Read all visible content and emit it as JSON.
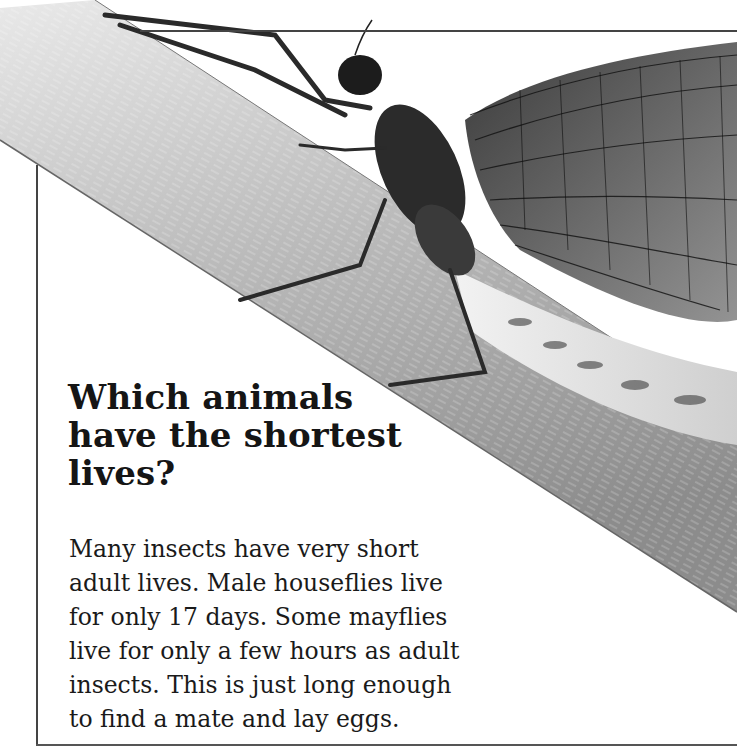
{
  "article": {
    "headline_lines": [
      "Which animals",
      "have the shortest",
      "lives?"
    ],
    "body_lines": [
      "Many insects have very short",
      "adult lives. Male houseflies live",
      "for only 17 days. Some mayflies",
      "live for only a few hours as adult",
      "insects. This is just long enough",
      "to find a mate and lay eggs."
    ]
  },
  "image": {
    "subject": "mayfly-on-plant-stem",
    "style": "black-and-white photograph"
  },
  "colors": {
    "text": "#151515",
    "frame": "#444444",
    "background": "#ffffff"
  }
}
